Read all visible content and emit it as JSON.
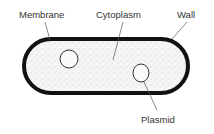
{
  "diagram": {
    "type": "bacterial cell",
    "labels": {
      "membrane": "Membrane",
      "cytoplasm": "Cytoplasm",
      "wall": "Wall",
      "plasmid": "Plasmid"
    },
    "colors": {
      "wall": "#111111",
      "cytoplasm": "#f4f4f2",
      "stipple": "#9a9a9a",
      "text": "#333333"
    }
  }
}
